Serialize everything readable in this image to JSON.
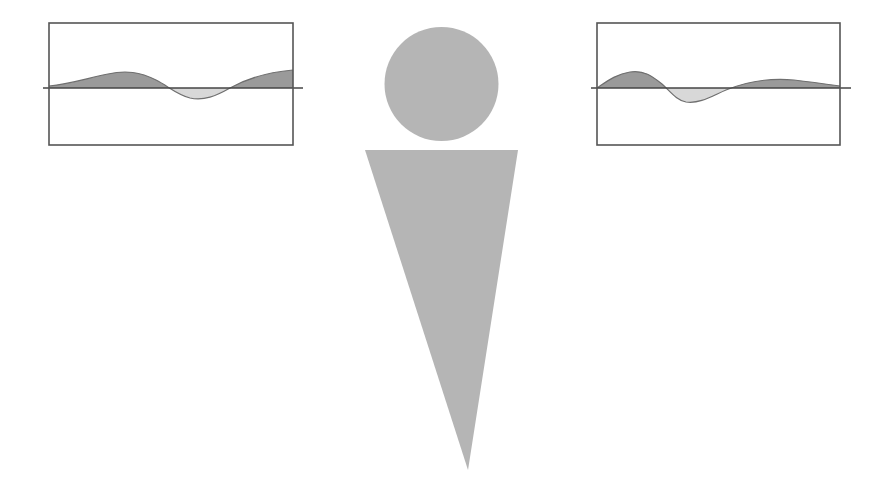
{
  "figure": {
    "title": "Stylized antenna figure flanked by two waveform panels",
    "background_color": "#ffffff",
    "width": 883,
    "height": 496
  },
  "palette": {
    "figure_fill": "#b5b5b5",
    "wave_fill_above": "#9a9a9a",
    "wave_fill_below": "#d8d8d8",
    "panel_border": "#555555",
    "baseline_color": "#444444",
    "background": "#ffffff"
  },
  "center_figure": {
    "name": "antenna-figure",
    "head": {
      "label": "head-circle",
      "shape": "circle",
      "cx": 441.5,
      "cy": 84,
      "r": 57,
      "fill": "#b5b5b5"
    },
    "body": {
      "label": "body-triangle",
      "shape": "triangle",
      "points": "365,150 518,150 468,470",
      "fill": "#b5b5b5",
      "top_left_x": 365,
      "top_right_x": 518,
      "top_y": 150,
      "tip_x": 468,
      "tip_y": 470
    }
  },
  "panels": [
    {
      "name": "left-waveform-panel",
      "position": "left",
      "rect": {
        "x": 49,
        "y": 23,
        "width": 244,
        "height": 122
      },
      "baseline": {
        "y": 88,
        "x_start": 43,
        "x_end": 303
      },
      "wave": {
        "phase_label": "leading",
        "curve_path": "M 49,86 C 70,84 88,78 108,74 C 126,70 140,72 156,80 C 168,86 176,94 190,98 C 204,101 216,96 230,88 C 248,78 270,72 293,70",
        "crossings_x": [
          155,
          236
        ],
        "peak_x": 112,
        "peak_y": 74,
        "trough_x": 190,
        "trough_y": 98,
        "fill_above": "#9a9a9a",
        "fill_below": "#d8d8d8"
      }
    },
    {
      "name": "right-waveform-panel",
      "position": "right",
      "rect": {
        "x": 597,
        "y": 23,
        "width": 243,
        "height": 122
      },
      "baseline": {
        "y": 88,
        "x_start": 591,
        "x_end": 851
      },
      "wave": {
        "phase_label": "shifted",
        "curve_path": "M 597,88 C 606,82 616,74 630,72 C 644,70 652,76 662,84 C 670,91 676,100 686,102 C 700,104 712,96 726,90 C 748,81 772,78 794,80 C 812,82 826,84 840,86",
        "crossings_x": [
          654,
          712
        ],
        "peak_x": 632,
        "peak_y": 72,
        "trough_x": 684,
        "trough_y": 102,
        "second_peak_x": 775,
        "second_peak_y": 78,
        "fill_above": "#9a9a9a",
        "fill_below": "#d8d8d8"
      }
    }
  ]
}
